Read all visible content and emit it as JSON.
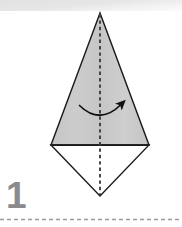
{
  "page": {
    "width": 182,
    "height": 227,
    "background_color": "#ffffff",
    "top_band_color": "#e6e6e6"
  },
  "step": {
    "number_label": "1",
    "number_color": "#8a8a8a"
  },
  "diagram": {
    "paper_fill_color": "#c8c8c8",
    "paper_back_color": "#ffffff",
    "outline_color": "#1a1a1a",
    "crease_color": "#4d4d4d",
    "arrow_color": "#111111",
    "apex": {
      "x": 100,
      "y": 13
    },
    "left_corner": {
      "x": 51,
      "y": 145
    },
    "right_corner": {
      "x": 149,
      "y": 145
    },
    "bottom_vertex": {
      "x": 100,
      "y": 196
    },
    "center_crease": {
      "x": 100,
      "y_start": 13,
      "y_end": 196
    },
    "horizontal_edge_y": 145,
    "fold_arrow": {
      "start_x": 80,
      "start_y": 106,
      "control_y": 124,
      "end_x": 122,
      "end_y": 104,
      "direction": "left-to-right"
    }
  },
  "separator": {
    "y": 219,
    "color": "#9a9a9a",
    "dash_length": 4,
    "gap_length": 3
  }
}
